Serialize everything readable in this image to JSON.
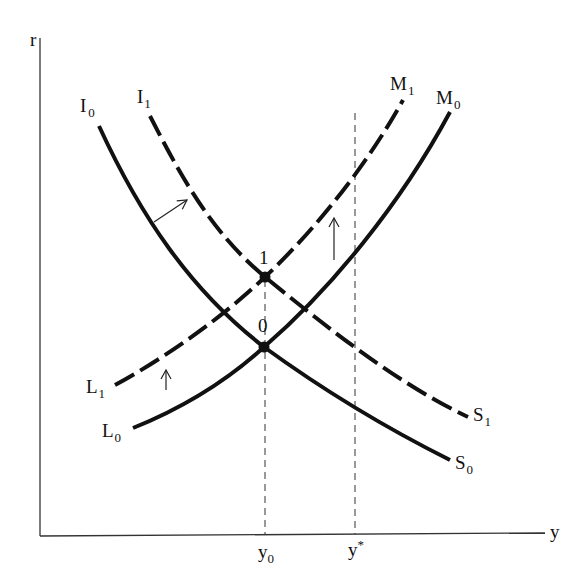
{
  "diagram": {
    "type": "IS-LM diagram",
    "axes": {
      "y_axis_label": "r",
      "x_axis_label": "y",
      "x_ticks": [
        {
          "base": "y",
          "sub": "0",
          "sup": ""
        },
        {
          "base": "y",
          "sub": "",
          "sup": "*"
        }
      ]
    },
    "curves": {
      "IS0": {
        "top_label": {
          "base": "I",
          "sub": "0"
        },
        "bottom_label": {
          "base": "S",
          "sub": "0"
        },
        "style": "solid"
      },
      "IS1": {
        "top_label": {
          "base": "I",
          "sub": "1"
        },
        "bottom_label": {
          "base": "S",
          "sub": "1"
        },
        "style": "dashed"
      },
      "LM0": {
        "bottom_label": {
          "base": "L",
          "sub": "0"
        },
        "top_label": {
          "base": "M",
          "sub": "0"
        },
        "style": "solid"
      },
      "LM1": {
        "bottom_label": {
          "base": "L",
          "sub": "1"
        },
        "top_label": {
          "base": "M",
          "sub": "1"
        },
        "style": "dashed"
      }
    },
    "equilibria": [
      {
        "label": "0",
        "description": "intersection of IS0 and LM0 at y0"
      },
      {
        "label": "1",
        "description": "intersection of IS1 and LM1 at y0"
      }
    ],
    "arrows": [
      {
        "description": "IS shift right",
        "direction": "up-right"
      },
      {
        "description": "LM shift up (left)",
        "direction": "up"
      },
      {
        "description": "LM shift up (right)",
        "direction": "up"
      }
    ],
    "colors": {
      "ink": "#111111",
      "axis": "#333333",
      "background": "#ffffff"
    }
  }
}
